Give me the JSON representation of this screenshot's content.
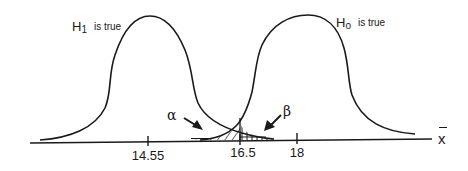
{
  "diagram": {
    "type": "hypothesis-test-distributions",
    "colors": {
      "stroke": "#1a1a1a",
      "background": "#ffffff"
    },
    "curves": [
      {
        "id": "h1",
        "label_main": "H",
        "label_sub": "1",
        "label_rest": "is true",
        "center_value": "14.55"
      },
      {
        "id": "h0",
        "label_main": "H",
        "label_sub": "o",
        "label_rest": "is true",
        "center_value": "18"
      }
    ],
    "axis": {
      "label": "x",
      "label_note": "x-bar (sample mean)",
      "ticks": [
        {
          "value": "14.55"
        },
        {
          "value": "16.5"
        },
        {
          "value": "18"
        }
      ]
    },
    "regions": {
      "alpha": {
        "symbol": "α",
        "description": "Type I error region (hatched, diagonal)"
      },
      "beta": {
        "symbol": "β",
        "description": "Type II error region (hatched, vertical)"
      }
    },
    "critical_value": "16.5"
  }
}
